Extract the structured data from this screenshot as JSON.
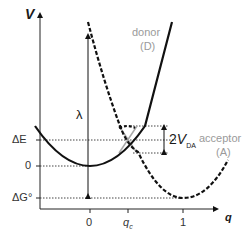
{
  "diagram": {
    "axes": {
      "y_label": "V",
      "x_label": "q",
      "y_ticks": [
        "ΔE",
        "0",
        "ΔG°"
      ],
      "x_ticks": [
        "0",
        "q_c",
        "1"
      ]
    },
    "curves": [
      {
        "name": "donor",
        "label_line1": "donor",
        "label_line2": "(D)",
        "style": "solid"
      },
      {
        "name": "acceptor",
        "label_line1": "acceptor",
        "label_line2": "(A)",
        "style": "dashed"
      }
    ],
    "annotations": {
      "lambda": "λ",
      "coupling_prefix": "2",
      "coupling_var": "V",
      "coupling_sub": "DA",
      "qc_var": "q",
      "qc_sub": "c"
    },
    "colors": {
      "curve": "#111111",
      "label_gray": "#9a9a9a",
      "diabatic_gray": "#a8a8a8"
    }
  }
}
